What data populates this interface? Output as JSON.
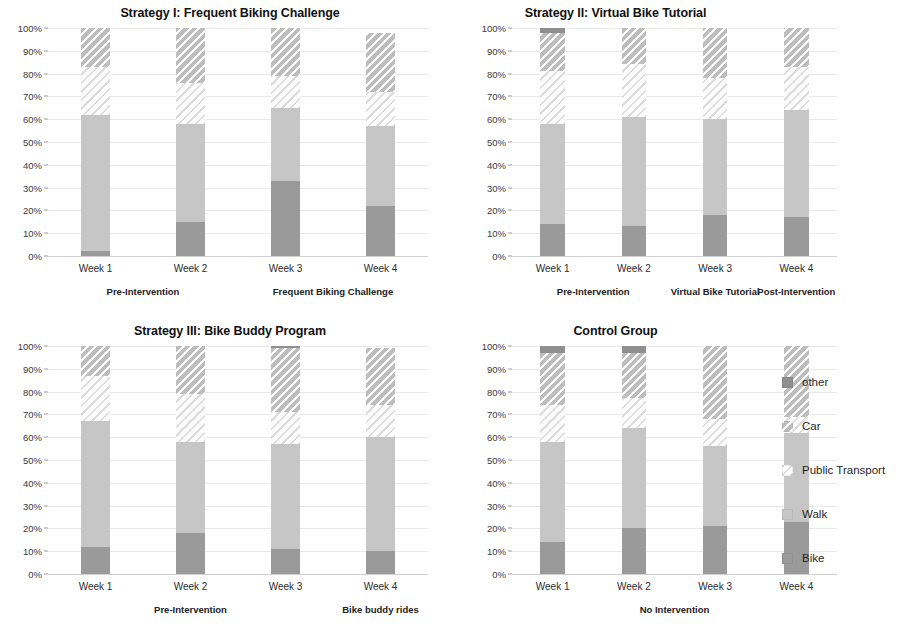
{
  "legend": {
    "position": "right",
    "items": [
      {
        "label": "other",
        "key": "other",
        "color": "#8f8f8f",
        "pattern": "solid"
      },
      {
        "label": "Car",
        "key": "car",
        "color": "#bdbdbd",
        "pattern": "hatch-dark"
      },
      {
        "label": "Public Transport",
        "key": "pt",
        "color": "#fdfdfd",
        "pattern": "hatch-light"
      },
      {
        "label": "Walk",
        "key": "walk",
        "color": "#c6c6c6",
        "pattern": "solid"
      },
      {
        "label": "Bike",
        "key": "bike",
        "color": "#9a9a9a",
        "pattern": "solid"
      }
    ]
  },
  "axis": {
    "yticks": [
      "0%",
      "10%",
      "20%",
      "30%",
      "40%",
      "50%",
      "60%",
      "70%",
      "80%",
      "90%",
      "100%"
    ],
    "ymin": 0,
    "ymax": 100
  },
  "chart_data": [
    {
      "type": "bar",
      "stacked": true,
      "title": "Strategy I: Frequent Biking Challenge",
      "xlabel": "",
      "ylabel": "",
      "ylim": [
        0,
        100
      ],
      "grid": true,
      "categories": [
        "Week 1",
        "Week 2",
        "Week 3",
        "Week 4"
      ],
      "series": [
        {
          "name": "Bike",
          "key": "bike",
          "values": [
            2,
            15,
            33,
            22
          ]
        },
        {
          "name": "Walk",
          "key": "walk",
          "values": [
            60,
            43,
            32,
            35
          ]
        },
        {
          "name": "Public Transport",
          "key": "pt",
          "values": [
            21,
            18,
            14,
            15
          ]
        },
        {
          "name": "Car",
          "key": "car",
          "values": [
            17,
            24,
            21,
            26
          ]
        },
        {
          "name": "other",
          "key": "other",
          "values": [
            0,
            0,
            0,
            0
          ]
        }
      ],
      "groups": [
        {
          "label": "Pre-Intervention",
          "from": 0,
          "to": 1
        },
        {
          "label": "Frequent Biking Challenge",
          "from": 2,
          "to": 3
        }
      ]
    },
    {
      "type": "bar",
      "stacked": true,
      "title": "Strategy II: Virtual Bike Tutorial",
      "xlabel": "",
      "ylabel": "",
      "ylim": [
        0,
        100
      ],
      "grid": true,
      "categories": [
        "Week 1",
        "Week 2",
        "Week 3",
        "Week 4"
      ],
      "series": [
        {
          "name": "Bike",
          "key": "bike",
          "values": [
            14,
            13,
            18,
            17
          ]
        },
        {
          "name": "Walk",
          "key": "walk",
          "values": [
            44,
            48,
            42,
            47
          ]
        },
        {
          "name": "Public Transport",
          "key": "pt",
          "values": [
            23,
            23,
            18,
            19
          ]
        },
        {
          "name": "Car",
          "key": "car",
          "values": [
            17,
            16,
            22,
            17
          ]
        },
        {
          "name": "other",
          "key": "other",
          "values": [
            2,
            0,
            0,
            0
          ]
        }
      ],
      "groups": [
        {
          "label": "Pre-Intervention",
          "from": 0,
          "to": 1
        },
        {
          "label": "Virtual Bike Tutorial",
          "from": 2,
          "to": 2
        },
        {
          "label": "Post-Intervention",
          "from": 3,
          "to": 3
        }
      ]
    },
    {
      "type": "bar",
      "stacked": true,
      "title": "Strategy III: Bike Buddy Program",
      "xlabel": "",
      "ylabel": "",
      "ylim": [
        0,
        100
      ],
      "grid": true,
      "categories": [
        "Week 1",
        "Week 2",
        "Week 3",
        "Week 4"
      ],
      "series": [
        {
          "name": "Bike",
          "key": "bike",
          "values": [
            12,
            18,
            11,
            10
          ]
        },
        {
          "name": "Walk",
          "key": "walk",
          "values": [
            55,
            40,
            46,
            50
          ]
        },
        {
          "name": "Public Transport",
          "key": "pt",
          "values": [
            20,
            21,
            14,
            14
          ]
        },
        {
          "name": "Car",
          "key": "car",
          "values": [
            13,
            21,
            28,
            25
          ]
        },
        {
          "name": "other",
          "key": "other",
          "values": [
            0,
            0,
            1,
            0
          ]
        }
      ],
      "groups": [
        {
          "label": "Pre-Intervention",
          "from": 0,
          "to": 2
        },
        {
          "label": "Bike buddy rides",
          "from": 3,
          "to": 3
        }
      ]
    },
    {
      "type": "bar",
      "stacked": true,
      "title": "Control Group",
      "xlabel": "",
      "ylabel": "",
      "ylim": [
        0,
        100
      ],
      "grid": true,
      "categories": [
        "Week 1",
        "Week 2",
        "Week 3",
        "Week 4"
      ],
      "series": [
        {
          "name": "Bike",
          "key": "bike",
          "values": [
            14,
            20,
            21,
            23
          ]
        },
        {
          "name": "Walk",
          "key": "walk",
          "values": [
            44,
            44,
            35,
            39
          ]
        },
        {
          "name": "Public Transport",
          "key": "pt",
          "values": [
            16,
            13,
            12,
            7
          ]
        },
        {
          "name": "Car",
          "key": "car",
          "values": [
            23,
            20,
            32,
            31
          ]
        },
        {
          "name": "other",
          "key": "other",
          "values": [
            3,
            3,
            0,
            0
          ]
        }
      ],
      "groups": [
        {
          "label": "No Intervention",
          "from": 0,
          "to": 3
        }
      ]
    }
  ]
}
